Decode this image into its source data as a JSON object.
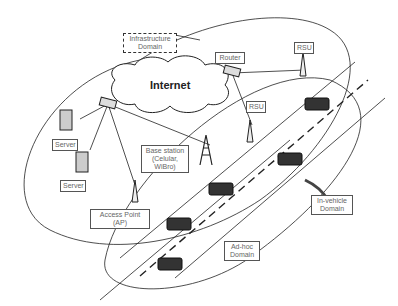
{
  "diagram": {
    "cloud_label": "Internet",
    "labels": {
      "infrastructure": "Infrastructure\nDomain",
      "router": "Router",
      "rsu_top": "RSU",
      "rsu_mid": "RSU",
      "server1": "Server",
      "server2": "Server",
      "base_station": "Base station\n(Celular,\nWiBro)",
      "access_point": "Access Point\n(AP)",
      "in_vehicle": "In-vehicle\nDomain",
      "adhoc": "Ad-hoc\nDomain"
    },
    "colors": {
      "stroke": "#222222",
      "label_text": "#666666",
      "vehicle": "#333333"
    }
  }
}
